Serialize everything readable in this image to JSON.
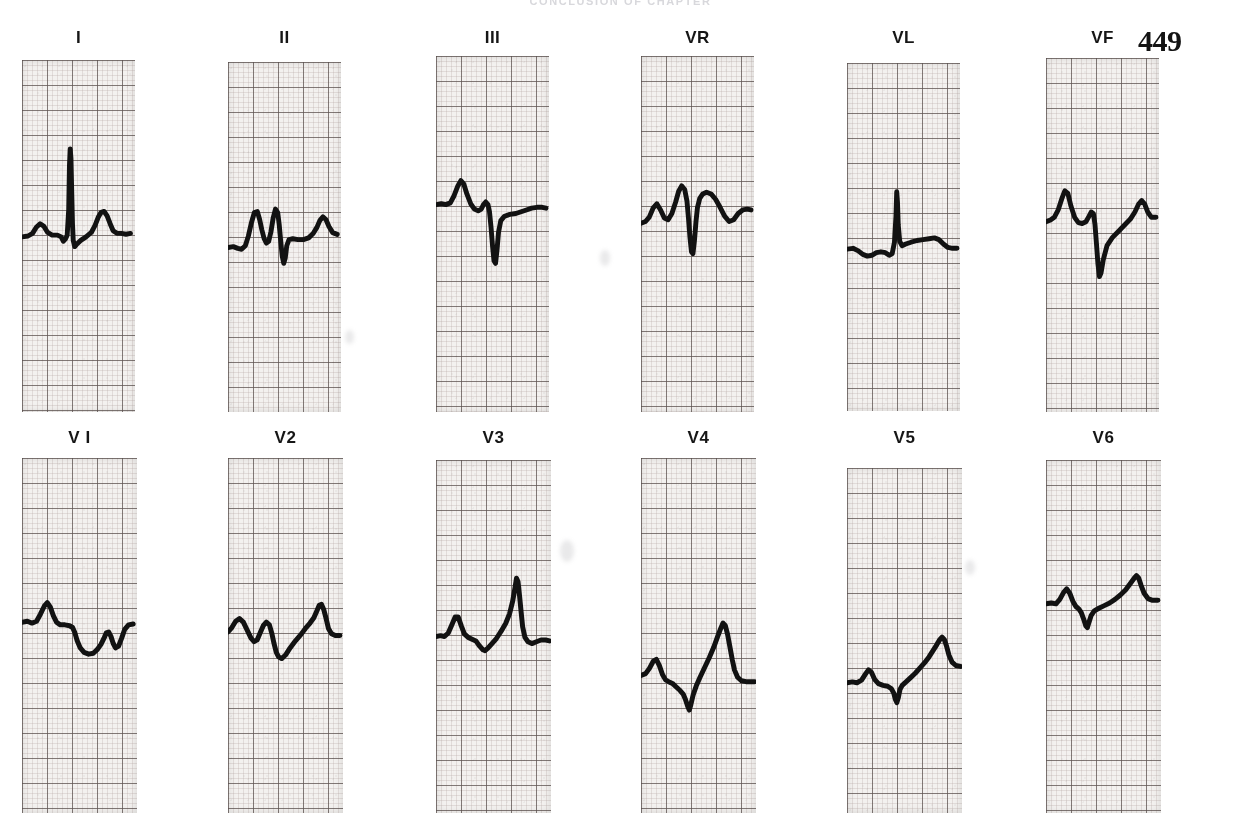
{
  "page": {
    "running_head": "CONCLUSION OF CHAPTER",
    "folio": "449",
    "background_color": "#ffffff",
    "paper_color": "#f3f1ef",
    "grid_fine_color": "#b4a8a4",
    "grid_bold_color": "#4a3f3d",
    "trace_color": "#121212"
  },
  "ecg": {
    "type": "12-lead electrocardiogram",
    "rows": 2,
    "columns": 6,
    "grid": {
      "small_box_px": 5,
      "large_box_px": 25,
      "paper_speed": "25 mm/s",
      "calibration": "10 mm/mV"
    },
    "leads": [
      {
        "label": "I",
        "row": 1,
        "col": 1,
        "x": 22,
        "y": 28,
        "strip_x": 22,
        "strip_y": 60,
        "strip_w": 113,
        "strip_h": 352,
        "baseline_y": 0.555,
        "trace": "M0,201 L8,200 L14,197 L19,190 L24,186 L29,189 L34,196 L40,199 L47,199 L52,201 L55,206 L58,203 L60,199 L62,170 L63,120 L64,101 L65,112 L66,150 L67,186 L68,205 L70,212 L73,209 L78,205 L85,201 L92,196 L97,188 L101,179 L105,173 L109,172 L113,177 L117,186 L121,194 L126,197 L132,197 L138,198 L144,197"
      },
      {
        "label": "II",
        "row": 1,
        "col": 2,
        "x": 228,
        "y": 28,
        "strip_x": 228,
        "strip_y": 62,
        "strip_w": 113,
        "strip_h": 350,
        "baseline_y": 0.545,
        "trace": "M0,212 L7,211 L13,213 L18,214 L23,210 L27,199 L31,184 L35,172 L39,171 L42,180 L45,192 L48,202 L51,207 L54,205 L57,194 L60,178 L63,168 L66,172 L68,186 L70,205 L72,222 L74,230 L76,224 L78,210 L81,203 L86,202 L93,203 L100,203 L107,201 L113,196 L118,189 L122,181 L126,177 L130,180 L134,188 L139,195 L145,197"
      },
      {
        "label": "III",
        "row": 1,
        "col": 3,
        "x": 436,
        "y": 28,
        "strip_x": 436,
        "strip_y": 56,
        "strip_w": 113,
        "strip_h": 356,
        "baseline_y": 0.445,
        "trace": "M0,167 L7,166 L13,167 L19,165 L24,157 L29,146 L33,140 L37,144 L41,155 L46,166 L51,172 L56,174 L60,172 L63,167 L66,164 L69,167 L71,175 L73,192 L75,213 L77,230 L79,233 L81,218 L83,198 L86,185 L91,180 L98,178 L106,177 L113,175 L120,173 L127,171 L134,170 L141,170 L146,171"
      },
      {
        "label": "VR",
        "row": 1,
        "col": 4,
        "x": 641,
        "y": 28,
        "strip_x": 641,
        "strip_y": 56,
        "strip_w": 113,
        "strip_h": 356,
        "baseline_y": 0.445,
        "trace": "M0,188 L6,186 L11,181 L16,171 L21,166 L26,173 L31,182 L36,184 L41,177 L46,164 L50,152 L54,146 L58,150 L61,163 L63,182 L65,204 L67,220 L69,222 L71,207 L73,186 L75,170 L78,160 L82,155 L87,153 L93,155 L99,161 L105,170 L111,180 L117,186 L123,184 L129,177 L135,173 L141,172 L146,173"
      },
      {
        "label": "VL",
        "row": 1,
        "col": 5,
        "x": 847,
        "y": 28,
        "strip_x": 847,
        "strip_y": 63,
        "strip_w": 113,
        "strip_h": 348,
        "baseline_y": 0.545,
        "trace": "M0,214 L8,213 L15,216 L21,220 L27,222 L33,221 L39,218 L45,217 L51,218 L56,221 L60,219 L63,206 L65,176 L66,148 L67,160 L68,186 L70,205 L73,210 L78,208 L85,206 L93,204 L101,203 L109,202 L116,201 L122,203 L128,208 L134,212 L140,213 L146,213"
      },
      {
        "label": "VF",
        "row": 1,
        "col": 6,
        "x": 1046,
        "y": 28,
        "strip_x": 1046,
        "strip_y": 58,
        "strip_w": 113,
        "strip_h": 354,
        "baseline_y": 0.455,
        "trace": "M0,185 L6,183 L11,180 L16,172 L21,159 L25,150 L29,153 L33,167 L38,180 L43,186 L48,187 L53,185 L57,179 L60,174 L63,176 L65,188 L67,210 L69,233 L71,247 L73,243 L76,228 L81,212 L88,203 L96,196 L104,189 L112,182 L118,174 L123,165 L127,161 L131,165 L135,174 L140,180 L146,180"
      },
      {
        "label": "V I",
        "row": 2,
        "col": 1,
        "x": 22,
        "y": 428,
        "strip_x": 22,
        "strip_y": 458,
        "strip_w": 115,
        "strip_h": 355,
        "baseline_y": 0.505,
        "trace": "M0,185 L7,184 L13,186 L19,184 L24,176 L29,167 L33,163 L37,168 L41,178 L45,185 L50,188 L56,188 L62,189 L66,191 L69,197 L72,206 L76,214 L81,219 L87,221 L93,220 L98,216 L103,210 L107,203 L110,197 L113,196 L116,201 L119,209 L122,214 L126,212 L130,203 L134,193 L139,188 L145,187"
      },
      {
        "label": "V2",
        "row": 2,
        "col": 2,
        "x": 228,
        "y": 428,
        "strip_x": 228,
        "strip_y": 458,
        "strip_w": 115,
        "strip_h": 355,
        "baseline_y": 0.495,
        "trace": "M0,196 L5,191 L10,184 L15,181 L20,185 L25,194 L30,203 L34,207 L38,205 L42,197 L46,189 L50,185 L54,188 L57,197 L60,209 L63,219 L66,224 L70,226 L75,222 L81,214 L88,206 L95,199 L101,192 L107,186 L112,180 L116,172 L119,166 L122,165 L125,171 L128,181 L131,192 L135,198 L140,200 L146,200"
      },
      {
        "label": "V3",
        "row": 2,
        "col": 3,
        "x": 436,
        "y": 428,
        "strip_x": 436,
        "strip_y": 460,
        "strip_w": 115,
        "strip_h": 353,
        "baseline_y": 0.505,
        "trace": "M0,200 L6,199 L11,200 L16,196 L21,186 L25,178 L29,178 L33,188 L37,197 L42,201 L47,203 L52,205 L57,211 L61,215 L64,216 L68,213 L73,208 L79,202 L85,194 L91,185 L96,174 L100,160 L103,145 L105,134 L107,138 L109,154 L111,172 L113,189 L116,201 L120,206 L125,208 L131,206 L137,204 L143,204 L148,205"
      },
      {
        "label": "V4",
        "row": 2,
        "col": 4,
        "x": 641,
        "y": 428,
        "strip_x": 641,
        "strip_y": 458,
        "strip_w": 115,
        "strip_h": 355,
        "baseline_y": 0.635,
        "trace": "M0,245 L6,243 L11,237 L16,229 L20,227 L24,234 L28,244 L32,250 L36,252 L41,254 L46,258 L51,262 L55,266 L58,272 L61,280 L63,284 L65,278 L68,267 L72,257 L77,247 L83,236 L89,225 L95,213 L100,201 L104,192 L107,186 L110,189 L113,199 L116,213 L119,227 L122,239 L126,247 L131,251 L137,252 L143,252 L148,252"
      },
      {
        "label": "V5",
        "row": 2,
        "col": 5,
        "x": 847,
        "y": 428,
        "strip_x": 847,
        "strip_y": 468,
        "strip_w": 115,
        "strip_h": 345,
        "baseline_y": 0.645,
        "trace": "M0,249 L7,248 L13,249 L19,246 L24,239 L28,234 L32,237 L36,245 L41,250 L47,252 L53,253 L58,256 L61,261 L63,268 L65,272 L67,266 L69,257 L72,252 L77,248 L83,243 L89,238 L95,232 L101,226 L107,219 L112,212 L117,205 L121,199 L124,196 L127,199 L130,207 L133,217 L137,225 L142,229 L148,230"
      },
      {
        "label": "V6",
        "row": 2,
        "col": 6,
        "x": 1046,
        "y": 428,
        "strip_x": 1046,
        "strip_y": 460,
        "strip_w": 115,
        "strip_h": 353,
        "baseline_y": 0.405,
        "trace": "M0,163 L7,162 L13,163 L18,158 L23,150 L27,146 L31,151 L35,160 L39,166 L43,169 L46,173 L49,180 L52,188 L54,190 L56,184 L59,176 L63,171 L69,168 L76,165 L83,162 L90,158 L97,153 L104,147 L110,140 L115,134 L118,131 L121,134 L124,142 L128,151 L133,157 L139,159 L146,159"
      }
    ]
  }
}
